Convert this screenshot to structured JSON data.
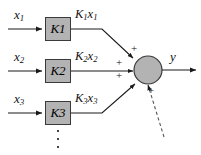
{
  "diagram": {
    "background_color": "#ffffff",
    "line_color": "#1a1a1a",
    "block_fill_color": "#b3b3b3",
    "block_border_color": "#3a3a3a",
    "node_fill_color": "#b3b3b3",
    "node_border_color": "#3a3a3a",
    "inputs": [
      {
        "input_label": "x",
        "input_subscript": "1",
        "gain_label": "K",
        "gain_subscript": "1",
        "signal_label": "K",
        "signal_subscript_1": "1",
        "signal_var": "x",
        "signal_subscript_2": "1",
        "sign": "+"
      },
      {
        "input_label": "x",
        "input_subscript": "2",
        "gain_label": "K",
        "gain_subscript": "2",
        "signal_label": "K",
        "signal_subscript_1": "2",
        "signal_var": "x",
        "signal_subscript_2": "2",
        "sign": "+"
      },
      {
        "input_label": "x",
        "input_subscript": "3",
        "gain_label": "K",
        "gain_subscript": "3",
        "signal_label": "K",
        "signal_subscript_1": "3",
        "signal_var": "x",
        "signal_subscript_2": "3",
        "sign": "+"
      }
    ],
    "additional_sign": "+",
    "output": {
      "label": "y"
    },
    "continuation": {
      "vertical_ellipsis": "⋮",
      "dashed_input": "dashed-arrow"
    }
  }
}
